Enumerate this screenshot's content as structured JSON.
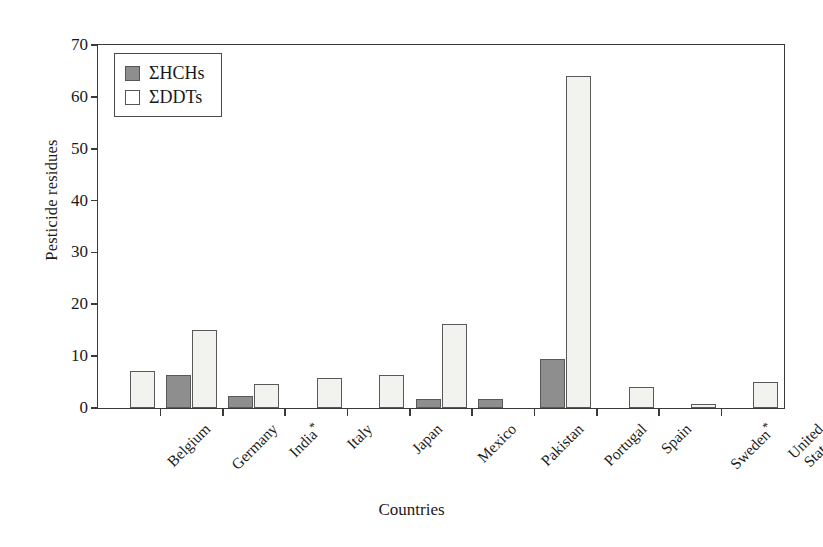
{
  "chart_data": {
    "type": "bar",
    "title": "",
    "xlabel": "Countries",
    "ylabel": "Pesticide residues",
    "ylim": [
      0,
      70
    ],
    "yticks": [
      0,
      10,
      20,
      30,
      40,
      50,
      60,
      70
    ],
    "ytick_labels": [
      "0",
      "10",
      "20",
      "30",
      "40",
      "50",
      "60",
      "70"
    ],
    "grid": false,
    "legend_position": "upper-left-inside",
    "categories": [
      "Belgium",
      "Germany",
      "India*",
      "Italy",
      "Japan",
      "Mexico",
      "Pakistan",
      "Portugal",
      "Spain",
      "Sweden*",
      "United States"
    ],
    "series": [
      {
        "name": "ΣHCHs",
        "color": "#8e8e8e",
        "values": [
          0,
          6.3,
          2.3,
          0,
          0,
          1.8,
          1.7,
          9.5,
          0,
          0,
          0
        ]
      },
      {
        "name": "ΣDDTs",
        "color": "#f2f2ef",
        "values": [
          7.2,
          15.1,
          4.7,
          5.7,
          6.3,
          16.2,
          0,
          64.0,
          4.0,
          0.7,
          5.0
        ]
      }
    ]
  },
  "legend": {
    "items": [
      {
        "label": "ΣHCHs",
        "swatch": "filled-gray-square"
      },
      {
        "label": "ΣDDTs",
        "swatch": "open-white-square"
      }
    ]
  },
  "axes": {
    "y_title": "Pesticide residues",
    "x_title": "Countries"
  },
  "colors": {
    "hchs": "#8e8e8e",
    "ddts": "#f2f2ef",
    "axis": "#3a3a3a",
    "background": "#ffffff"
  }
}
